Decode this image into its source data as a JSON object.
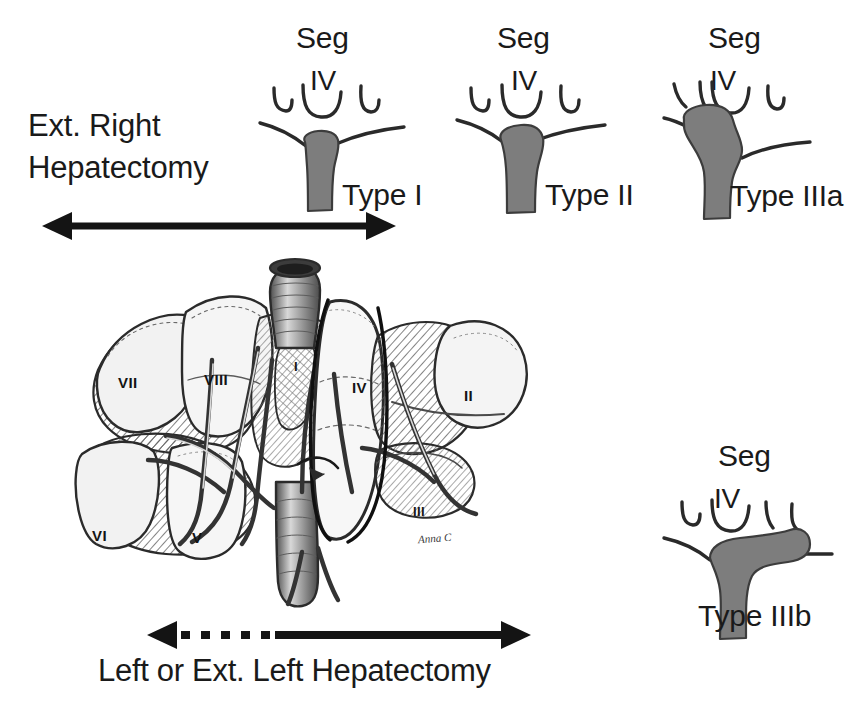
{
  "figure": {
    "background_color": "#ffffff",
    "tumor_fill_color": "#7d7d7d",
    "line_color": "#2a2a2a"
  },
  "resection_labels": {
    "right_line1": "Ext. Right",
    "right_line2": "Hepatectomy",
    "bottom": "Left or Ext. Left Hepatectomy"
  },
  "types": [
    {
      "id": "type-1",
      "seg_label": "Seg",
      "seg_number": "IV",
      "type_label": "Type I"
    },
    {
      "id": "type-2",
      "seg_label": "Seg",
      "seg_number": "IV",
      "type_label": "Type II"
    },
    {
      "id": "type-3a",
      "seg_label": "Seg",
      "seg_number": "IV",
      "type_label": "Type IIIa"
    },
    {
      "id": "type-3b",
      "seg_label": "Seg",
      "seg_number": "IV",
      "type_label": "Type IIIb"
    }
  ],
  "liver": {
    "segments": [
      {
        "label": "VII"
      },
      {
        "label": "VIII"
      },
      {
        "label": "I"
      },
      {
        "label": "IV"
      },
      {
        "label": "II"
      },
      {
        "label": "VI"
      },
      {
        "label": "V"
      },
      {
        "label": "III"
      }
    ],
    "artist_signature": "Anna C"
  },
  "arrows": {
    "top": {
      "style": "solid",
      "heads": "both"
    },
    "bottom": {
      "style": "dashed-then-solid",
      "heads": "both"
    }
  }
}
